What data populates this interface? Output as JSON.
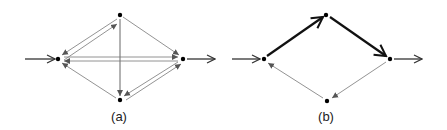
{
  "diagrams": [
    {
      "id": "a",
      "label": "(a)",
      "nodes": {
        "left": [
          58,
          59
        ],
        "top": [
          120,
          15
        ],
        "right": [
          183,
          59
        ],
        "bottom": [
          120,
          100
        ]
      },
      "input_arrow": {
        "from": [
          25,
          59
        ],
        "to": [
          55,
          59
        ]
      },
      "output_arrow": {
        "from": [
          187,
          59
        ],
        "to": [
          215,
          59
        ]
      },
      "edges": [
        {
          "from": "top",
          "to": "left",
          "style": "thin",
          "note": "double edge left-top, arrowheads toward both ends"
        },
        {
          "from": "left",
          "to": "top",
          "style": "thin"
        },
        {
          "from": "top",
          "to": "right",
          "style": "thin"
        },
        {
          "from": "top",
          "to": "bottom",
          "style": "thin"
        },
        {
          "from": "left",
          "to": "right",
          "style": "thin"
        },
        {
          "from": "right",
          "to": "left",
          "style": "thin"
        },
        {
          "from": "right",
          "to": "bottom",
          "style": "thin"
        },
        {
          "from": "bottom",
          "to": "right",
          "style": "thin"
        },
        {
          "from": "bottom",
          "to": "left",
          "style": "thin"
        }
      ]
    },
    {
      "id": "b",
      "label": "(b)",
      "nodes": {
        "left": [
          264,
          59
        ],
        "top": [
          326,
          15
        ],
        "right": [
          390,
          59
        ],
        "bottom": [
          327,
          101
        ]
      },
      "input_arrow": {
        "from": [
          232,
          59
        ],
        "to": [
          260,
          59
        ]
      },
      "output_arrow": {
        "from": [
          394,
          59
        ],
        "to": [
          422,
          59
        ]
      },
      "edges": [
        {
          "from": "left",
          "to": "top",
          "style": "bold"
        },
        {
          "from": "top",
          "to": "right",
          "style": "bold"
        },
        {
          "from": "right",
          "to": "bottom",
          "style": "thin"
        },
        {
          "from": "bottom",
          "to": "left",
          "style": "thin"
        }
      ]
    }
  ],
  "colors": {
    "line": "#333333",
    "thin_line": "#666666",
    "node": "#000000"
  }
}
